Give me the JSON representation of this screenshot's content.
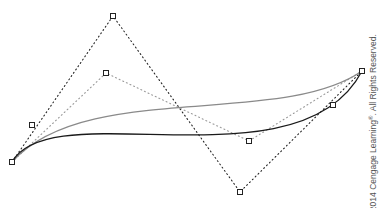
{
  "diagram": {
    "colors": {
      "background": "#ffffff",
      "primary_curve": "#1a1a1a",
      "secondary_curve": "#8a8a8a",
      "control_polygon": "#222222",
      "subdivided_polygon": "#9a9a9a",
      "handle_stroke": "#222222",
      "handle_fill": "#ffffff"
    },
    "control_polygon": [
      [
        12,
        162
      ],
      [
        113,
        16
      ],
      [
        240,
        192
      ],
      [
        362,
        71
      ]
    ],
    "subdivided_polygon": [
      [
        12,
        162
      ],
      [
        106,
        73
      ],
      [
        249,
        141
      ],
      [
        362,
        71
      ]
    ],
    "primary_curve": {
      "p0": [
        12,
        162
      ],
      "p1": [
        52,
        92
      ],
      "p2": [
        300,
        190
      ],
      "p3": [
        362,
        71
      ]
    },
    "secondary_curve": {
      "p0": [
        12,
        162
      ],
      "p1": [
        85,
        80
      ],
      "p2": [
        280,
        128
      ],
      "p3": [
        362,
        71
      ]
    },
    "handles": [
      {
        "name": "start-point",
        "x": 12,
        "y": 162
      },
      {
        "name": "top-control-point",
        "x": 113,
        "y": 16
      },
      {
        "name": "bottom-control-point",
        "x": 240,
        "y": 192
      },
      {
        "name": "end-point",
        "x": 362,
        "y": 71
      },
      {
        "name": "curve-peak-point",
        "x": 106,
        "y": 73
      },
      {
        "name": "curve-trough-point",
        "x": 249,
        "y": 141
      },
      {
        "name": "left-tangent-point",
        "x": 32,
        "y": 125
      },
      {
        "name": "right-tangent-point",
        "x": 333,
        "y": 105
      }
    ]
  },
  "copyright": {
    "prefix": "© 2014 Cengage Learning",
    "mark": "®",
    "suffix": ". All Rights Reserved."
  }
}
